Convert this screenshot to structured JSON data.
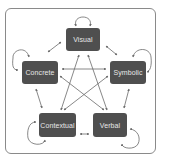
{
  "diagram": {
    "type": "relationship-network",
    "nodes": [
      {
        "id": "visual",
        "label": "Visual",
        "x": 66,
        "y": 28,
        "w": 34,
        "h": 23
      },
      {
        "id": "concrete",
        "label": "Concrete",
        "x": 22,
        "y": 61,
        "w": 36,
        "h": 23
      },
      {
        "id": "symbolic",
        "label": "Symbolic",
        "x": 110,
        "y": 61,
        "w": 36,
        "h": 23
      },
      {
        "id": "contextual",
        "label": "Contextual",
        "x": 39,
        "y": 113,
        "w": 37,
        "h": 24
      },
      {
        "id": "verbal",
        "label": "Verbal",
        "x": 93,
        "y": 113,
        "w": 34,
        "h": 24
      }
    ],
    "edges": [
      {
        "from": "visual",
        "to": "visual",
        "type": "self-loop"
      },
      {
        "from": "concrete",
        "to": "concrete",
        "type": "self-loop"
      },
      {
        "from": "symbolic",
        "to": "symbolic",
        "type": "self-loop"
      },
      {
        "from": "contextual",
        "to": "contextual",
        "type": "self-loop"
      },
      {
        "from": "verbal",
        "to": "verbal",
        "type": "self-loop"
      },
      {
        "from": "visual",
        "to": "concrete",
        "type": "bidirectional"
      },
      {
        "from": "visual",
        "to": "symbolic",
        "type": "bidirectional"
      },
      {
        "from": "concrete",
        "to": "symbolic",
        "type": "bidirectional"
      },
      {
        "from": "concrete",
        "to": "contextual",
        "type": "bidirectional"
      },
      {
        "from": "symbolic",
        "to": "verbal",
        "type": "bidirectional"
      },
      {
        "from": "contextual",
        "to": "verbal",
        "type": "bidirectional"
      },
      {
        "from": "visual",
        "to": "contextual",
        "type": "bidirectional"
      },
      {
        "from": "visual",
        "to": "verbal",
        "type": "bidirectional"
      },
      {
        "from": "concrete",
        "to": "verbal",
        "type": "bidirectional"
      },
      {
        "from": "symbolic",
        "to": "contextual",
        "type": "bidirectional"
      }
    ],
    "colors": {
      "node_fill": "#4f4f4f",
      "node_text": "#e8e8e8",
      "edge": "#6a6a6a",
      "frame": "#8a8a8a",
      "background": "#ffffff"
    }
  }
}
